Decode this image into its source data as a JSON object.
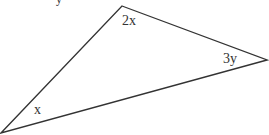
{
  "diagram": {
    "type": "triangle",
    "stroke_color": "#333333",
    "vertices": {
      "top": {
        "x": 122,
        "y": 6
      },
      "right": {
        "x": 267,
        "y": 60
      },
      "bottom_left": {
        "x": 1,
        "y": 133
      }
    },
    "angle_labels": {
      "top": "2x",
      "right": "3y",
      "bottom_left": "x"
    },
    "cropped_top_fragment": "y"
  }
}
